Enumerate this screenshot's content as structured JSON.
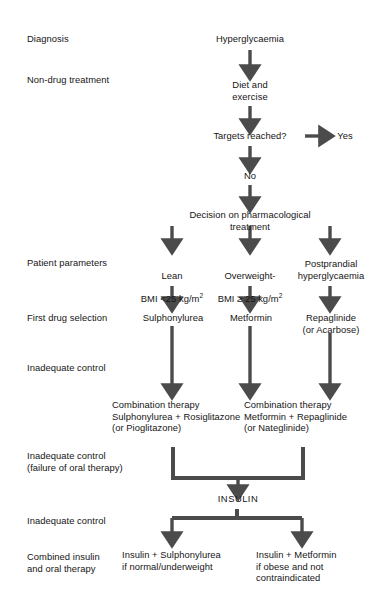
{
  "colors": {
    "arrow": "#4b4b4b",
    "text": "#151515",
    "background": "#ffffff"
  },
  "stage_labels": [
    {
      "id": "diagnosis",
      "text": "Diagnosis"
    },
    {
      "id": "non-drug-treatment",
      "text": "Non-drug treatment"
    },
    {
      "id": "patient-parameters",
      "text": "Patient parameters"
    },
    {
      "id": "first-drug-selection",
      "text": "First drug selection"
    },
    {
      "id": "inadequate-control-1",
      "text": "Inadequate control"
    },
    {
      "id": "inadequate-control-2",
      "text": "Inadequate control\n(failure of oral therapy)"
    },
    {
      "id": "inadequate-control-3",
      "text": "Inadequate control"
    },
    {
      "id": "combined-insulin-oral",
      "text": "Combined insulin\nand oral therapy"
    }
  ],
  "nodes": {
    "hyperglycaemia": "Hyperglycaemia",
    "diet_and_exercise": "Diet and\nexercise",
    "targets_reached": "Targets reached?",
    "yes": "Yes",
    "no": "No",
    "decision": "Decision on pharmacological treatment",
    "branch_lean_line1": "Lean",
    "branch_lean_line2_pre": "BMI <25 kg/m",
    "branch_lean_line2_sup": "2",
    "branch_overweight_line1": "Overweight-",
    "branch_overweight_line2_pre": "BMI ≥ 25 kg/m",
    "branch_overweight_line2_sup": "2",
    "branch_postprandial": "Postprandial\nhyperglycaemia",
    "drug_sulphonylurea": "Sulphonylurea",
    "drug_metformin": "Metformin",
    "drug_repaglinide": "Repaglinide\n(or Acarbose)",
    "combo_left": "Combination therapy\nSulphonylurea + Rosiglitazone\n(or Pioglitazone)",
    "combo_right": "Combination therapy\nMetformin + Repaglinide\n(or Nateglinide)",
    "insulin": "INSULIN",
    "final_left": "Insulin + Sulphonylurea\nif normal/underweight",
    "final_right": "Insulin + Metformin\nif obese and not\ncontraindicated"
  }
}
